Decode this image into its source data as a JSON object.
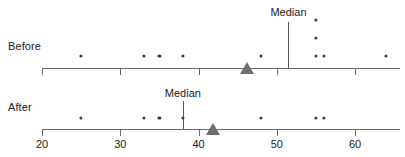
{
  "chart_data": {
    "type": "scatter",
    "title": "",
    "xlabel": "",
    "ylabel": "",
    "xlim": [
      20,
      64
    ],
    "x_ticks": [
      20,
      30,
      40,
      50,
      60
    ],
    "x_tick_labels": [
      "20",
      "30",
      "40",
      "50",
      "60"
    ],
    "grid": false,
    "legend": "none",
    "groups": [
      {
        "name": "Before",
        "label": "Before",
        "median": 51.5,
        "median_label": "Median",
        "mean": 46.2,
        "values": [
          25,
          33,
          35,
          38,
          48,
          55,
          55,
          55,
          56,
          64
        ],
        "points": [
          {
            "value": 25,
            "stack": 1
          },
          {
            "value": 33,
            "stack": 1
          },
          {
            "value": 35,
            "stack": 1
          },
          {
            "value": 38,
            "stack": 1
          },
          {
            "value": 48,
            "stack": 1
          },
          {
            "value": 55,
            "stack": 1
          },
          {
            "value": 55,
            "stack": 2
          },
          {
            "value": 55,
            "stack": 3
          },
          {
            "value": 56,
            "stack": 1
          },
          {
            "value": 64,
            "stack": 1
          }
        ]
      },
      {
        "name": "After",
        "label": "After",
        "median": 38,
        "median_label": "Median",
        "mean": 41.8,
        "values": [
          25,
          33,
          35,
          38,
          48,
          55,
          56
        ],
        "points": [
          {
            "value": 25,
            "stack": 1
          },
          {
            "value": 33,
            "stack": 1
          },
          {
            "value": 35,
            "stack": 1
          },
          {
            "value": 38,
            "stack": 1
          },
          {
            "value": 48,
            "stack": 1
          },
          {
            "value": 55,
            "stack": 1
          },
          {
            "value": 56,
            "stack": 1
          }
        ]
      }
    ],
    "colors": {
      "dot": "#3a3a3a",
      "axis": "#6b6b6b",
      "median_line": "#5a5a5a",
      "mean_marker": "#6e6e6e",
      "text": "#1a1a1a"
    }
  }
}
